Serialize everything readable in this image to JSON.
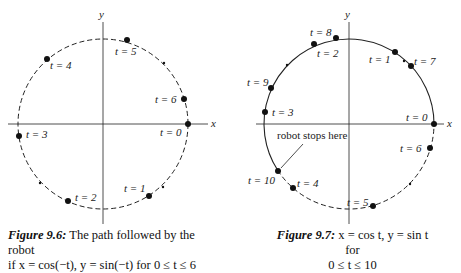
{
  "figures": [
    {
      "id": "fig-9-6",
      "axis_labels": {
        "x": "x",
        "y": "y"
      },
      "points": [
        {
          "label": "t = 0"
        },
        {
          "label": "t = 1"
        },
        {
          "label": "t = 2"
        },
        {
          "label": "t = 3"
        },
        {
          "label": "t = 4"
        },
        {
          "label": "t = 5"
        },
        {
          "label": "t = 6"
        }
      ],
      "caption": {
        "title": "Figure 9.6:",
        "text_line1": "The path followed by the robot",
        "text_line2": "if x = cos(−t), y = sin(−t) for 0 ≤ t ≤ 6"
      }
    },
    {
      "id": "fig-9-7",
      "axis_labels": {
        "x": "x",
        "y": "y"
      },
      "points": [
        {
          "label": "t = 0"
        },
        {
          "label": "t = 1"
        },
        {
          "label": "t = 2"
        },
        {
          "label": "t = 3"
        },
        {
          "label": "t = 4"
        },
        {
          "label": "t = 5"
        },
        {
          "label": "t = 6"
        },
        {
          "label": "t = 7"
        },
        {
          "label": "t = 8"
        },
        {
          "label": "t = 9"
        },
        {
          "label": "t = 10"
        }
      ],
      "annotation": "robot stops here",
      "caption": {
        "title": "Figure 9.7:",
        "text_line1": "x = cos t, y = sin t for",
        "text_line2": "0 ≤ t ≤ 10"
      }
    }
  ]
}
